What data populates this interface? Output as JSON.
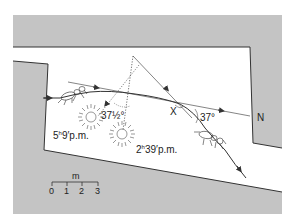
{
  "diagram": {
    "colors": {
      "background": "#ffffff",
      "wall": "#c4c4c4",
      "wall_edge": "#333333",
      "line": "#333333"
    },
    "labels": {
      "angle_left": "37½°",
      "angle_right": "37°",
      "point_x": "X",
      "north": "N",
      "sun_early_hour": "5",
      "sun_early_rest": "9′p.m.",
      "sun_early_h": "h",
      "sun_late_hour": "2",
      "sun_late_h": "h",
      "sun_late_rest": "39′p.m."
    },
    "scale_bar": {
      "unit": "m",
      "ticks": [
        "0",
        "1",
        "2",
        "3"
      ]
    },
    "icons": [
      "ant-icon",
      "ant-icon",
      "sun-icon",
      "sun-icon"
    ]
  }
}
